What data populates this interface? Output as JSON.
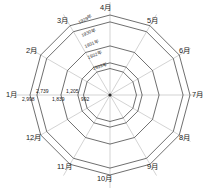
{
  "chart_data": {
    "type": "radar",
    "title": "",
    "subtitle": "",
    "xlabel": "",
    "ylabel": "",
    "grid": true,
    "legend_position": "inline-on-axis",
    "categories": [
      "1月",
      "2月",
      "3月",
      "4月",
      "5月",
      "6月",
      "7月",
      "8月",
      "9月",
      "10月",
      "11月",
      "12月"
    ],
    "axis_start_angle_deg": 90,
    "axis_direction": "clockwise",
    "rlim": [
      0,
      2998
    ],
    "ring_labels": [
      "1929年",
      "1930年",
      "1931年",
      "1932年",
      "1933年"
    ],
    "ring_values": [
      2998,
      2739,
      1839,
      1205,
      992
    ],
    "value_tick_labels": [
      "2,998",
      "2,739",
      "1,839",
      "1,205",
      "992"
    ],
    "series": [
      {
        "name": "1929年",
        "values": [
          2998,
          2998,
          2998,
          2998,
          2998,
          2998,
          2998,
          2998,
          2998,
          2998,
          2998,
          2998
        ]
      },
      {
        "name": "1930年",
        "values": [
          2739,
          2739,
          2739,
          2739,
          2739,
          2739,
          2739,
          2739,
          2739,
          2739,
          2739,
          2739
        ]
      },
      {
        "name": "1931年",
        "values": [
          1839,
          1839,
          1839,
          1839,
          1839,
          1839,
          1839,
          1839,
          1839,
          1839,
          1839,
          1839
        ]
      },
      {
        "name": "1932年",
        "values": [
          1205,
          1205,
          1205,
          1205,
          1205,
          1205,
          1205,
          1205,
          1205,
          1205,
          1205,
          1205
        ]
      },
      {
        "name": "1933年",
        "values": [
          992,
          992,
          992,
          992,
          992,
          992,
          992,
          992,
          992,
          992,
          992,
          992
        ]
      }
    ],
    "colors": {
      "background": "#ffffff",
      "ring_stroke": "#3f3f3f",
      "axis_stroke": "#b5b5b5",
      "text": "#1a1a1a"
    }
  },
  "months": {
    "m1": "1月",
    "m2": "2月",
    "m3": "3月",
    "m4": "4月",
    "m5": "5月",
    "m6": "6月",
    "m7": "7月",
    "m8": "8月",
    "m9": "9月",
    "m10": "10月",
    "m11": "11月",
    "m12": "12月"
  },
  "years": {
    "y1929": "1929年",
    "y1930": "1930年",
    "y1931": "1931年",
    "y1932": "1932年",
    "y1933": "1933年"
  },
  "values": {
    "v1": "2,998",
    "v2": "2,739",
    "v3": "1,839",
    "v4": "1,205",
    "v5": "992"
  }
}
